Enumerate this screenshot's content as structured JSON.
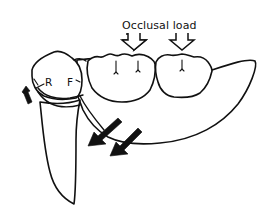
{
  "diagram": {
    "title_label": "Occlusal load",
    "labels": {
      "rest": "R",
      "fulcrum": "F"
    },
    "elements": [
      "abutment-tooth",
      "denture-base-saddle",
      "artificial-tooth-1",
      "artificial-tooth-2",
      "occlusal-load-arrow-1",
      "occlusal-load-arrow-2",
      "rotation-arrow",
      "tissue-displacement-arrow-1",
      "tissue-displacement-arrow-2"
    ],
    "colors": {
      "ink": "#111111",
      "background": "#ffffff"
    }
  }
}
